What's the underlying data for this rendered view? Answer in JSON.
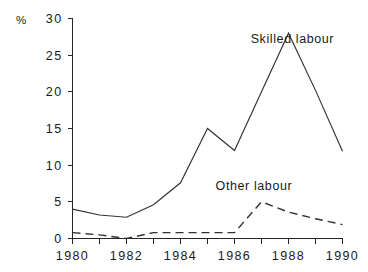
{
  "chart_data": {
    "type": "line",
    "title": "",
    "xlabel": "",
    "ylabel": "%",
    "yunit": "%",
    "xlim": [
      1980,
      1990
    ],
    "ylim": [
      0,
      30
    ],
    "grid": false,
    "legend_position": "inline-annotation",
    "x": [
      1980,
      1981,
      1982,
      1983,
      1984,
      1985,
      1986,
      1987,
      1988,
      1989,
      1990
    ],
    "xtick_labels": [
      "1980",
      "1982",
      "1984",
      "1986",
      "1988",
      "1990"
    ],
    "xtick_values": [
      1980,
      1982,
      1984,
      1986,
      1988,
      1990
    ],
    "xtick_minor_values": [
      1981,
      1983,
      1985,
      1987,
      1989
    ],
    "ytick_labels": [
      "0",
      "5",
      "10",
      "15",
      "20",
      "25",
      "30"
    ],
    "ytick_values": [
      0,
      5,
      10,
      15,
      20,
      25,
      30
    ],
    "series": [
      {
        "name": "Skilled labour",
        "style": "solid",
        "label_x": 1986.6,
        "label_y": 26.6,
        "values": [
          4.0,
          3.2,
          2.9,
          4.6,
          7.6,
          15.0,
          12.0,
          20.0,
          28.0,
          20.2,
          11.9
        ]
      },
      {
        "name": "Other labour",
        "style": "dashed",
        "label_x": 1985.3,
        "label_y": 6.6,
        "values": [
          0.8,
          0.5,
          0.0,
          0.8,
          0.8,
          0.8,
          0.8,
          5.0,
          3.6,
          2.7,
          1.9
        ]
      }
    ],
    "colors": {
      "axis": "#262626",
      "line": "#333333",
      "text": "#1a1a1a",
      "background": "#ffffff"
    }
  }
}
